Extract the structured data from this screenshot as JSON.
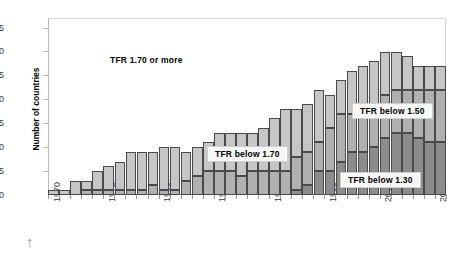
{
  "chart_data": {
    "type": "bar",
    "stacked": true,
    "title": "",
    "xlabel": "",
    "ylabel": "Number of countries",
    "ylim": [
      0,
      37
    ],
    "ytick_labels": [
      "0",
      "5",
      "10",
      "15",
      "20",
      "25",
      "30",
      "35"
    ],
    "ytick_values": [
      0,
      5,
      10,
      15,
      20,
      25,
      30,
      35
    ],
    "grid": false,
    "legend_position": "in-plot-annotations",
    "x": [
      1970,
      1971,
      1972,
      1973,
      1974,
      1975,
      1976,
      1977,
      1978,
      1979,
      1980,
      1981,
      1982,
      1983,
      1984,
      1985,
      1986,
      1987,
      1988,
      1989,
      1990,
      1991,
      1992,
      1993,
      1994,
      1995,
      1996,
      1997,
      1998,
      1999,
      2000,
      2001,
      2002,
      2003,
      2004,
      2005
    ],
    "xtick_labels": [
      "1970",
      "1975",
      "1980",
      "1985",
      "1990",
      "1995",
      "2000",
      "2005"
    ],
    "xtick_values": [
      1970,
      1975,
      1980,
      1985,
      1990,
      1995,
      2000,
      2005
    ],
    "series": [
      {
        "name": "TFR below 1.30",
        "color": "#8c8c8c",
        "values": [
          0,
          0,
          0,
          0,
          0,
          0,
          0,
          0,
          0,
          0,
          0,
          0,
          0,
          0,
          0,
          0,
          0,
          0,
          0,
          0,
          0,
          0,
          1,
          2,
          5,
          5,
          7,
          9,
          9,
          10,
          12,
          13,
          13,
          12,
          11,
          11
        ]
      },
      {
        "name": "TFR below 1.70",
        "color": "#b0b0b0",
        "values": [
          0,
          0,
          0,
          1,
          1,
          1,
          1,
          1,
          1,
          2,
          1,
          1,
          3,
          4,
          5,
          5,
          5,
          4,
          5,
          5,
          5,
          5,
          7,
          7,
          6,
          9,
          10,
          8,
          10,
          9,
          9,
          9,
          9,
          10,
          11,
          11
        ]
      },
      {
        "name": "TFR 1.70 or more",
        "color": "#c6c6c6",
        "values": [
          1,
          1,
          3,
          2,
          4,
          5,
          6,
          8,
          8,
          7,
          9,
          9,
          6,
          6,
          6,
          8,
          8,
          9,
          8,
          9,
          11,
          13,
          10,
          10,
          11,
          7,
          7,
          9,
          8,
          9,
          9,
          8,
          7,
          5,
          5,
          5
        ]
      }
    ],
    "totals": [
      1,
      1,
      3,
      3,
      5,
      6,
      7,
      9,
      9,
      9,
      10,
      10,
      9,
      10,
      11,
      13,
      13,
      13,
      13,
      14,
      16,
      18,
      18,
      19,
      22,
      21,
      24,
      26,
      27,
      28,
      30,
      30,
      29,
      27,
      27,
      27
    ],
    "annotations": [
      {
        "id": "label-high",
        "text": "TFR 1.70 or more",
        "boxed": false
      },
      {
        "id": "label-mid",
        "text": "TFR below  1.70",
        "boxed": true
      },
      {
        "id": "label-150",
        "text": "TFR below  1.50",
        "boxed": true
      },
      {
        "id": "label-low",
        "text": "TFR below  1.30",
        "boxed": true
      }
    ]
  },
  "footer": {
    "arrow_icon": "↑"
  }
}
